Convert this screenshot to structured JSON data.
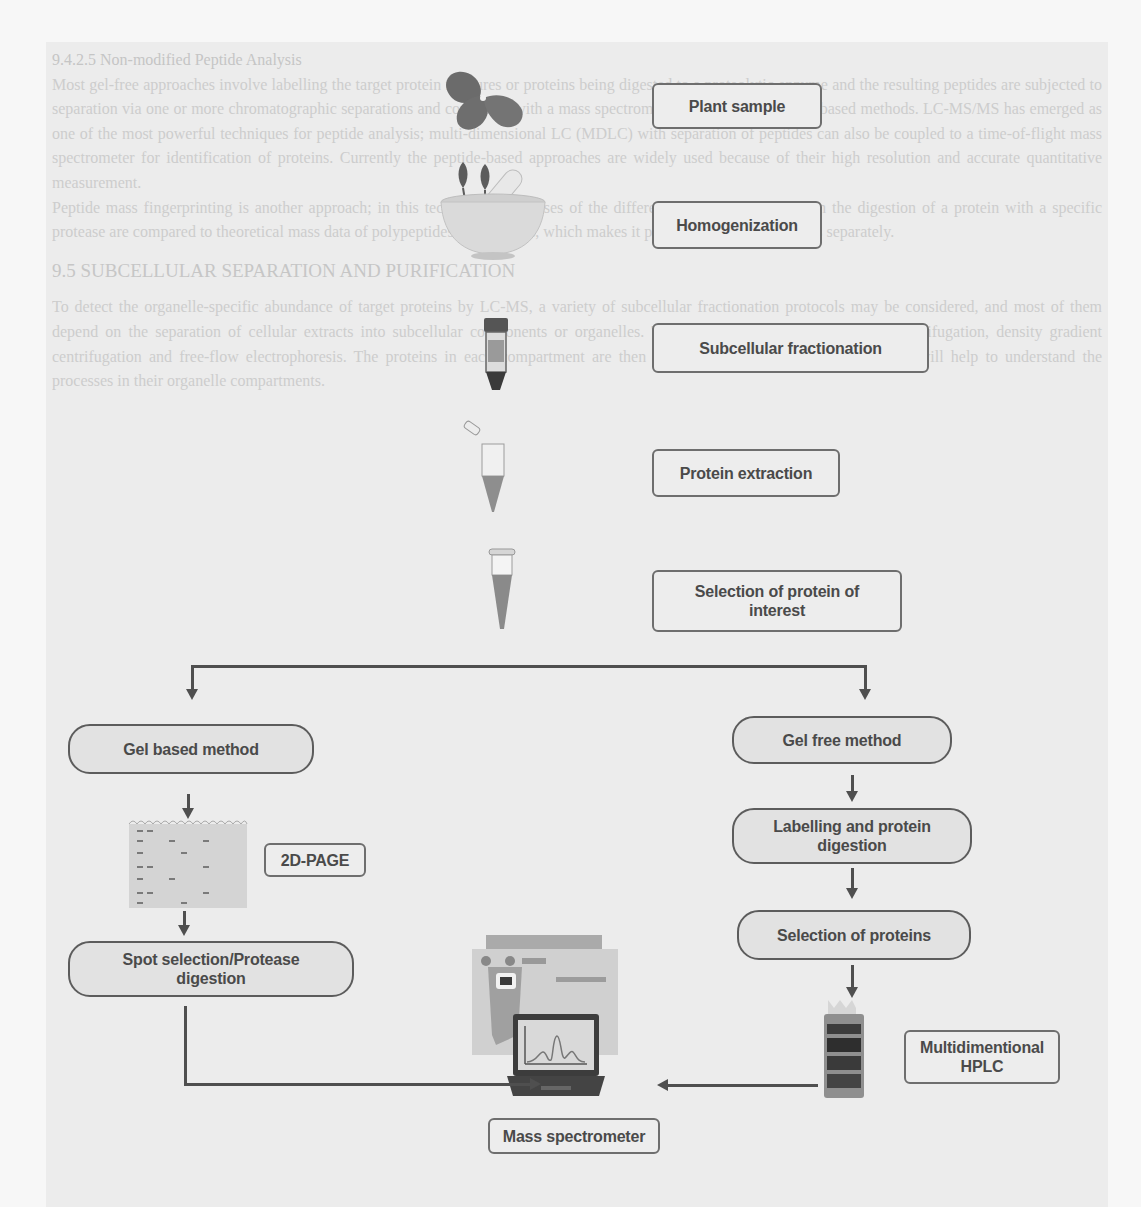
{
  "background_text": {
    "section_heading": "9.4.2.5 Non-modified Peptide Analysis",
    "paragraphs": [
      "Most gel-free approaches involve labelling the target protein mixtures or proteins being digested to a proteolytic enzyme and the resulting peptides are subjected to separation via one or more chromatographic separations and connected with a mass spectrometer. An alternative is gel-based methods. LC-MS/MS has emerged as one of the most powerful techniques for peptide analysis; multi-dimensional LC (MDLC) with separation of peptides can also be coupled to a time-of-flight mass spectrometer for identification of proteins. Currently the peptide-based approaches are widely used because of their high resolution and accurate quantitative measurement.",
      "Peptide mass fingerprinting is another approach; in this technique the masses of the different peptides resulting from the digestion of a protein with a specific protease are compared to theoretical mass data of polypeptides in databases, which makes it possible to identify proteins separately."
    ],
    "section_title": "9.5 SUBCELLULAR SEPARATION AND PURIFICATION",
    "paragraph_after": "To detect the organelle-specific abundance of target proteins by LC-MS, a variety of subcellular fractionation protocols may be considered, and most of them depend on the separation of cellular extracts into subcellular components or organelles. These protocols include differential centrifugation, density gradient centrifugation and free-flow electrophoresis. The proteins in each compartment are then analysed by mass spectrometry, which will help to understand the processes in their organelle compartments."
  },
  "flowchart": {
    "main_steps": [
      {
        "id": "plant-sample",
        "label": "Plant sample",
        "icon": "strawberry-plant-icon"
      },
      {
        "id": "homogenization",
        "label": "Homogenization",
        "icon": "mortar-pestle-icon"
      },
      {
        "id": "subcellular-fractionation",
        "label": "Subcellular fractionation",
        "icon": "centrifuge-tube-icon"
      },
      {
        "id": "protein-extraction",
        "label": "Protein extraction",
        "icon": "open-microtube-icon"
      },
      {
        "id": "selection-protein-interest",
        "label": "Selection of protein of interest",
        "icon": "closed-microtube-icon"
      }
    ],
    "gel_based_branch": {
      "method": "Gel based method",
      "technique": "2D-PAGE",
      "technique_icon": "gel-electrophoresis-icon",
      "step": "Spot selection/Protease digestion"
    },
    "gel_free_branch": {
      "method": "Gel free method",
      "steps": [
        "Labelling and protein digestion",
        "Selection of proteins"
      ],
      "technique": "Multidimentional HPLC",
      "technique_icon": "hplc-instrument-icon"
    },
    "endpoint": {
      "label": "Mass spectrometer",
      "icons": [
        "mass-spectrometer-instrument-icon",
        "laptop-spectrum-icon"
      ]
    }
  },
  "colors": {
    "page_bg": "#f7f7f7",
    "band_bg": "#ececec",
    "box_border": "#6e6e6e",
    "pill_fill": "#e2e2e2",
    "text": "#4a4a4a",
    "connector": "#4f4f4f"
  }
}
